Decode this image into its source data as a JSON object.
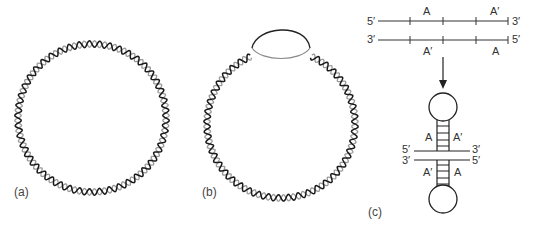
{
  "figure": {
    "panels": [
      {
        "id": "a",
        "label": "(a)",
        "description": "closed circular double-stranded DNA"
      },
      {
        "id": "b",
        "label": "(b)",
        "description": "circular DNA with single-stranded bubble"
      },
      {
        "id": "c",
        "label": "(c)",
        "description": "inverted repeats forming cruciform"
      }
    ],
    "panel_c": {
      "top_strand": {
        "left_end": "5′",
        "right_end": "3′",
        "segments": [
          "A",
          "A′"
        ]
      },
      "bottom_strand": {
        "left_end": "3′",
        "right_end": "5′",
        "segments": [
          "A′",
          "A"
        ]
      },
      "cruciform": {
        "upper_left": "A",
        "upper_right": "A′",
        "lower_left": "A′",
        "lower_right": "A",
        "mid_top_left": "5′",
        "mid_top_right": "3′",
        "mid_bottom_left": "3′",
        "mid_bottom_right": "5′"
      }
    },
    "colors": {
      "strand_dark": "#1a1a1a",
      "strand_light": "#9a9a9a",
      "line": "#222222"
    }
  }
}
